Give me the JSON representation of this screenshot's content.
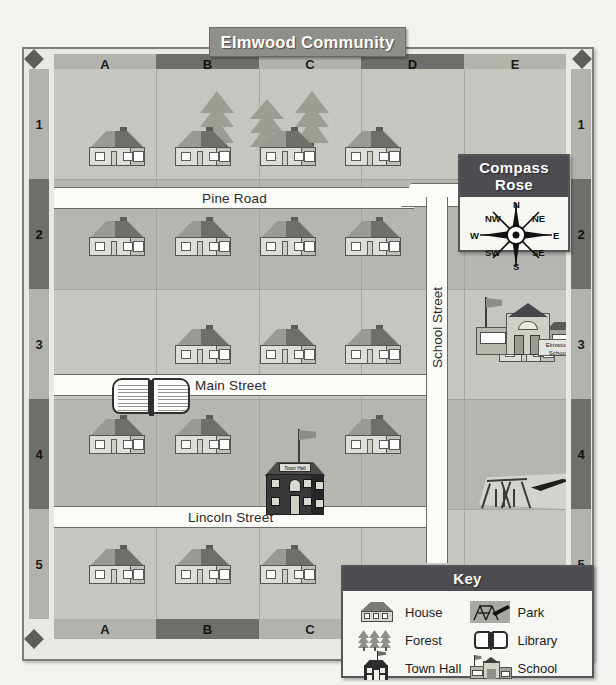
{
  "map": {
    "title": "Elmwood Community",
    "column_labels_top": [
      "A",
      "B",
      "C",
      "D",
      "E"
    ],
    "column_labels_bottom": [
      "A",
      "B",
      "C"
    ],
    "row_labels_left": [
      "1",
      "2",
      "3",
      "4",
      "5"
    ],
    "row_labels_right": [
      "1",
      "2",
      "3",
      "4",
      "5"
    ],
    "streets": [
      {
        "name": "Pine Road",
        "orientation": "horizontal"
      },
      {
        "name": "Main Street",
        "orientation": "horizontal"
      },
      {
        "name": "Lincoln Street",
        "orientation": "horizontal"
      },
      {
        "name": "School Street",
        "orientation": "vertical"
      }
    ],
    "place_labels": {
      "town_hall_sign": "Town Hall",
      "school_sign_line1": "Elmwood",
      "school_sign_line2": "School"
    }
  },
  "compass": {
    "title": "Compass Rose",
    "directions": [
      "N",
      "NE",
      "E",
      "SE",
      "S",
      "SW",
      "W",
      "NW"
    ]
  },
  "key": {
    "title": "Key",
    "entries": [
      {
        "label": "House",
        "icon": "house-icon"
      },
      {
        "label": "Park",
        "icon": "park-icon"
      },
      {
        "label": "Forest",
        "icon": "forest-icon"
      },
      {
        "label": "Library",
        "icon": "library-icon"
      },
      {
        "label": "Town Hall",
        "icon": "town-hall-icon"
      },
      {
        "label": "School",
        "icon": "school-icon"
      }
    ]
  },
  "colors": {
    "page_background": "#f2f2ee",
    "map_land": "#c0c0ba",
    "road_fill": "#fbfbf8",
    "panel_header": "#4d4d51",
    "grid_bar_light": "#b3b3ad",
    "grid_bar_dark": "#6e6e6a",
    "title_plaque": "#8f8f8a"
  }
}
